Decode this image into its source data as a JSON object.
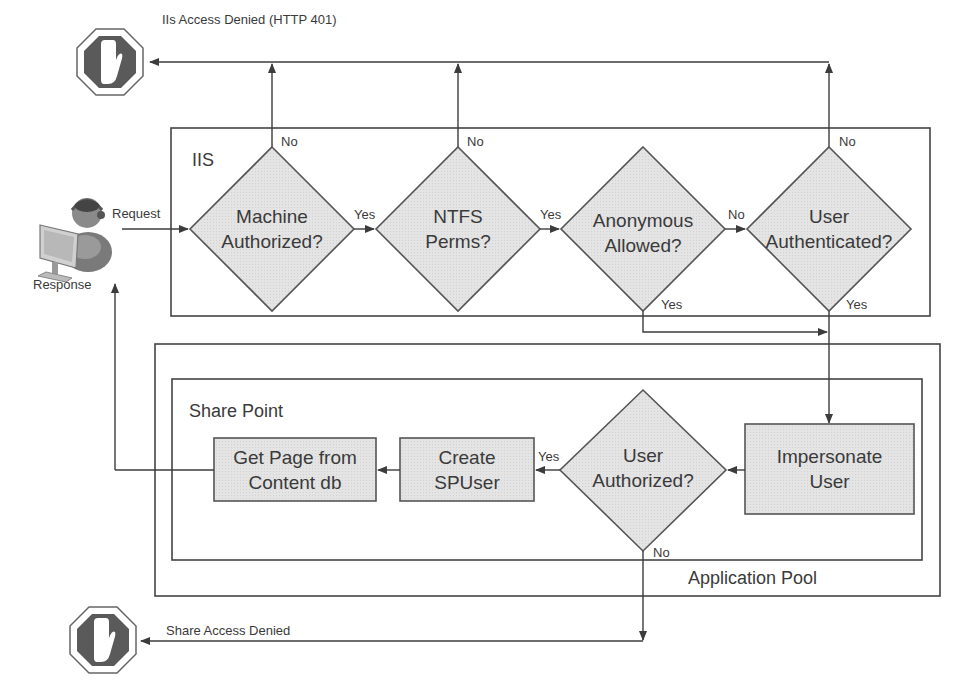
{
  "colors": {
    "line": "#3c3c3c",
    "node_fill": "#e2e2e2",
    "node_stroke": "#555555",
    "stop_fill": "#5a5a5a"
  },
  "endpoints": {
    "iis_denied": "IIs Access Denied (HTTP 401)",
    "share_denied": "Share Access Denied",
    "user_request": "Request",
    "user_response": "Response"
  },
  "groups": {
    "iis": "IIS",
    "sharepoint": "Share Point",
    "app_pool": "Application Pool"
  },
  "decisions": {
    "machine_authorized": "Machine Authorized?",
    "ntfs_perms": "NTFS Perms?",
    "anonymous_allowed": "Anonymous Allowed?",
    "user_authenticated": "User Authenticated?",
    "user_authorized": "User Authorized?"
  },
  "decision_lines": {
    "machine_authorized": [
      "Machine",
      "Authorized?"
    ],
    "ntfs_perms": [
      "NTFS",
      "Perms?"
    ],
    "anonymous_allowed": [
      "Anonymous",
      "Allowed?"
    ],
    "user_authenticated": [
      "User",
      "Authenticated?"
    ],
    "user_authorized": [
      "User",
      "Authorized?"
    ]
  },
  "processes": {
    "impersonate_user": [
      "Impersonate",
      "User"
    ],
    "create_spuser": [
      "Create",
      "SPUser"
    ],
    "get_page": [
      "Get Page from",
      "Content db"
    ]
  },
  "edge_labels": {
    "machine_no": "No",
    "machine_yes": "Yes",
    "ntfs_no": "No",
    "ntfs_yes": "Yes",
    "anon_no": "No",
    "anon_yes": "Yes",
    "auth_no": "No",
    "auth_yes": "Yes",
    "authz_yes": "Yes",
    "authz_no": "No"
  }
}
